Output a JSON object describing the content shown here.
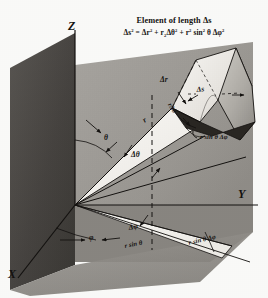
{
  "figure": {
    "name": "spherical-coordinate-volume-element",
    "title": "Element of length Δs",
    "equation_plain": "Δs² = Δr² + r² Δθ² + r² sin² θ Δφ²",
    "equation_parts": {
      "lhs_base": "Δs",
      "lhs_exp": "2",
      "eq": "=",
      "t1_base": "Δr",
      "t1_exp": "2",
      "plus1": "+",
      "t2_base": "r",
      "t2_sub": "2",
      "t2_delta": "Δθ",
      "t2_exp": "2",
      "plus2": "+",
      "t3_base": "r",
      "t3_exp": "2",
      "t3_sin": "sin",
      "t3_sin_exp": "2",
      "t3_theta": "θ",
      "t3_delta": "Δφ",
      "t3_delta_exp": "2"
    },
    "axes": [
      {
        "id": "z",
        "label": "Z"
      },
      {
        "id": "y",
        "label": "Y"
      },
      {
        "id": "x",
        "label": "X"
      }
    ],
    "labels": [
      {
        "id": "theta",
        "text": "θ"
      },
      {
        "id": "delta-theta",
        "text": "Δθ"
      },
      {
        "id": "radius",
        "text": "r"
      },
      {
        "id": "delta-r",
        "text": "Δr"
      },
      {
        "id": "delta-s",
        "text": "Δs"
      },
      {
        "id": "r-delta-theta",
        "text": "rΔθ"
      },
      {
        "id": "r-sin-theta-delta-phi-upper",
        "text": "r sin θ Δφ"
      },
      {
        "id": "phi",
        "text": "φ"
      },
      {
        "id": "delta-phi",
        "text": "Δφ"
      },
      {
        "id": "r-sin-theta",
        "text": "r sin θ"
      },
      {
        "id": "r-sin-theta-delta-phi-lower",
        "text": "r sin θ Δφ"
      }
    ],
    "colors": {
      "paper": "#fdfdfb",
      "ink": "#141210",
      "plane_xz_dark": "#4a4744",
      "plane_xy_mid": "#8e8b86",
      "wedge_light": "#f2f0ec",
      "wedge_shadow": "#26241f",
      "wedge_mid": "#b3afa9"
    }
  }
}
